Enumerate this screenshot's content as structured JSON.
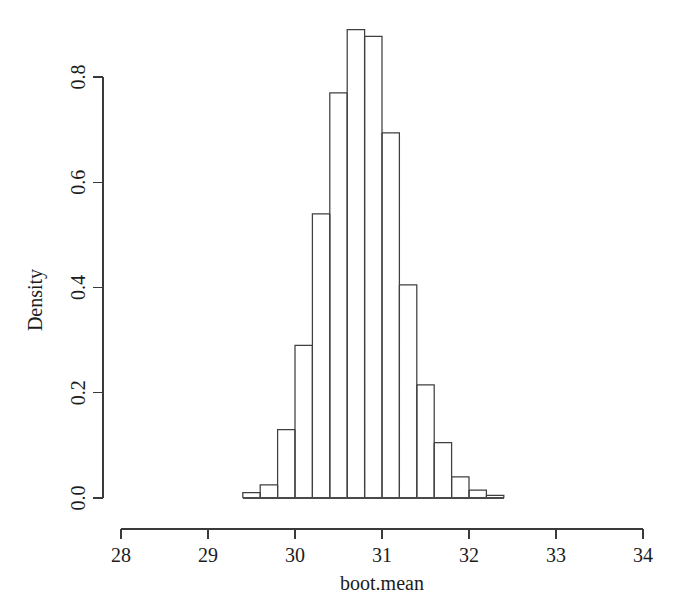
{
  "chart_data": {
    "type": "bar",
    "subtype": "histogram",
    "title": "",
    "subtitle": "",
    "xlabel": "boot.mean",
    "ylabel": "Density",
    "xlim": [
      28,
      34
    ],
    "ylim": [
      0.0,
      0.9
    ],
    "xticks": [
      28,
      29,
      30,
      31,
      32,
      33,
      34
    ],
    "xtick_labels": [
      "28",
      "29",
      "30",
      "31",
      "32",
      "33",
      "34"
    ],
    "yticks": [
      0.0,
      0.2,
      0.4,
      0.6,
      0.8
    ],
    "ytick_labels": [
      "0.0",
      "0.2",
      "0.4",
      "0.6",
      "0.8"
    ],
    "grid": false,
    "legend": null,
    "bin_width": 0.2,
    "bin_edges": [
      29.4,
      29.6,
      29.8,
      30.0,
      30.2,
      30.4,
      30.6,
      30.8,
      31.0,
      31.2,
      31.4,
      31.6,
      31.8,
      32.0,
      32.2,
      32.4
    ],
    "categories": [
      "29.4-29.6",
      "29.6-29.8",
      "29.8-30.0",
      "30.0-30.2",
      "30.2-30.4",
      "30.4-30.6",
      "30.6-30.8",
      "30.8-31.0",
      "31.0-31.2",
      "31.2-31.4",
      "31.4-31.6",
      "31.6-31.8",
      "31.8-32.0",
      "32.0-32.2",
      "32.2-32.4"
    ],
    "values": [
      0.01,
      0.025,
      0.13,
      0.29,
      0.54,
      0.77,
      0.89,
      0.877,
      0.694,
      0.405,
      0.215,
      0.105,
      0.04,
      0.015,
      0.005
    ],
    "bar_edge_color": "#3f3f3f",
    "bar_fill_color": "#ffffff",
    "axis_color": "#3a3a3a"
  },
  "figure": {
    "background_color": "#ffffff",
    "caption": ""
  }
}
